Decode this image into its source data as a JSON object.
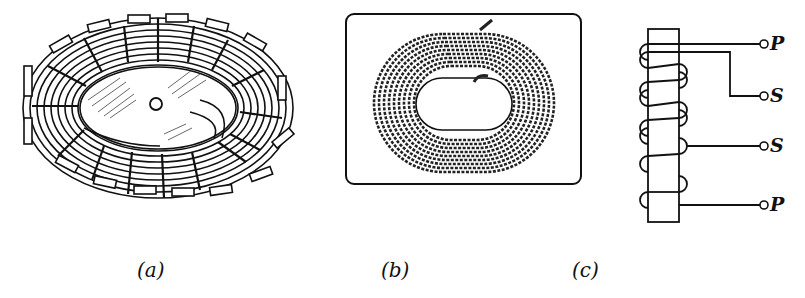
{
  "figures": {
    "a": {
      "caption": "(a)",
      "description": "Toroidal core with segmented laminated windings around elliptical ring"
    },
    "b": {
      "caption": "(b)",
      "description": "Spiral wound core inside rectangular frame"
    },
    "c": {
      "caption": "(c)",
      "description": "Winding diagram with primary and secondary coils on core",
      "terminals": [
        "P",
        "S",
        "S",
        "P"
      ]
    }
  },
  "colors": {
    "ink": "#111111",
    "background": "#ffffff"
  }
}
